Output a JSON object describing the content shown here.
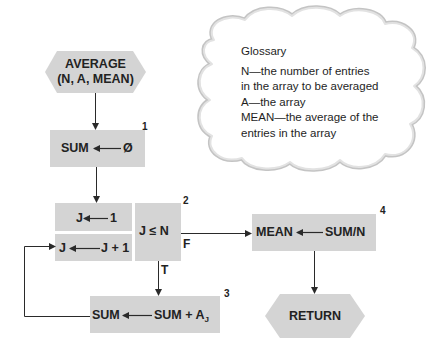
{
  "colors": {
    "box_fill": "#d4d4d4",
    "line": "#2a2a2a",
    "cloud_edge": "#b8b8b8",
    "text": "#1e1e1e"
  },
  "flowchart": {
    "start": {
      "line1": "AVERAGE",
      "line2": "(N, A, MEAN)"
    },
    "step1": {
      "number": "1",
      "left": "SUM",
      "right": "Ø"
    },
    "init": {
      "left": "J",
      "right": "1"
    },
    "increment": {
      "left": "J",
      "right": "J + 1"
    },
    "step2": {
      "number": "2",
      "condition": "J ≤ N",
      "false_label": "F",
      "true_label": "T"
    },
    "step3": {
      "number": "3",
      "left": "SUM",
      "right": "SUM + A",
      "subscript": "J"
    },
    "step4": {
      "number": "4",
      "left": "MEAN",
      "right": "SUM/N"
    },
    "end": {
      "label": "RETURN"
    }
  },
  "glossary": {
    "title": "Glossary",
    "lines": [
      "N—the number of entries",
      "in the array to be averaged",
      "A—the array",
      "MEAN—the average of the",
      "entries in the array"
    ]
  }
}
